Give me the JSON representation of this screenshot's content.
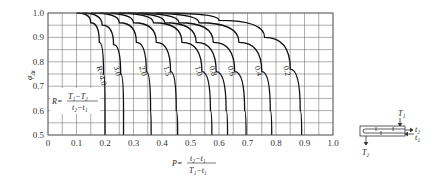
{
  "chart_data": {
    "type": "line",
    "title": "",
    "xlabel": "P = (t2 - t1) / (T1 - t1)",
    "ylabel": "φΔt",
    "xlim": [
      0,
      1.0
    ],
    "ylim": [
      0.5,
      1.0
    ],
    "grid": true,
    "x_ticks": [
      "0",
      "0.1",
      "0.2",
      "0.3",
      "0.4",
      "0.5",
      "0.6",
      "0.7",
      "0.8",
      "0.9",
      "1.0"
    ],
    "y_ticks": [
      "0.5",
      "0.6",
      "0.7",
      "0.8",
      "0.9",
      "1.0"
    ],
    "parameter_label": "R = (T1 - T2) / (t2 - t1)",
    "series": [
      {
        "name": "R=4.0",
        "label": "R=4.0",
        "points": [
          [
            0.1,
            1.0
          ],
          [
            0.15,
            0.96
          ],
          [
            0.18,
            0.88
          ],
          [
            0.195,
            0.75
          ],
          [
            0.2,
            0.6
          ],
          [
            0.2,
            0.5
          ]
        ]
      },
      {
        "name": "3.0",
        "label": "3.0",
        "points": [
          [
            0.12,
            1.0
          ],
          [
            0.19,
            0.95
          ],
          [
            0.23,
            0.87
          ],
          [
            0.255,
            0.75
          ],
          [
            0.265,
            0.6
          ],
          [
            0.265,
            0.5
          ]
        ]
      },
      {
        "name": "2.0",
        "label": "2.0",
        "points": [
          [
            0.15,
            1.0
          ],
          [
            0.25,
            0.96
          ],
          [
            0.31,
            0.88
          ],
          [
            0.345,
            0.76
          ],
          [
            0.36,
            0.6
          ],
          [
            0.362,
            0.5
          ]
        ]
      },
      {
        "name": "1.5",
        "label": "1.5",
        "points": [
          [
            0.18,
            1.0
          ],
          [
            0.3,
            0.96
          ],
          [
            0.38,
            0.88
          ],
          [
            0.43,
            0.76
          ],
          [
            0.45,
            0.6
          ],
          [
            0.455,
            0.5
          ]
        ]
      },
      {
        "name": "1.0",
        "label": "1.0",
        "points": [
          [
            0.22,
            1.0
          ],
          [
            0.37,
            0.96
          ],
          [
            0.47,
            0.88
          ],
          [
            0.54,
            0.76
          ],
          [
            0.57,
            0.6
          ],
          [
            0.575,
            0.5
          ]
        ]
      },
      {
        "name": "0.8",
        "label": "0.8",
        "points": [
          [
            0.25,
            1.0
          ],
          [
            0.41,
            0.96
          ],
          [
            0.52,
            0.88
          ],
          [
            0.59,
            0.76
          ],
          [
            0.625,
            0.6
          ],
          [
            0.63,
            0.5
          ]
        ]
      },
      {
        "name": "0.6",
        "label": "0.6",
        "points": [
          [
            0.28,
            1.0
          ],
          [
            0.46,
            0.96
          ],
          [
            0.58,
            0.88
          ],
          [
            0.655,
            0.76
          ],
          [
            0.69,
            0.6
          ],
          [
            0.695,
            0.5
          ]
        ]
      },
      {
        "name": "0.4",
        "label": "0.4",
        "points": [
          [
            0.32,
            1.0
          ],
          [
            0.53,
            0.96
          ],
          [
            0.67,
            0.88
          ],
          [
            0.75,
            0.76
          ],
          [
            0.78,
            0.6
          ],
          [
            0.785,
            0.5
          ]
        ]
      },
      {
        "name": "0.2",
        "label": "0.2",
        "points": [
          [
            0.38,
            1.0
          ],
          [
            0.6,
            0.97
          ],
          [
            0.76,
            0.9
          ],
          [
            0.85,
            0.77
          ],
          [
            0.885,
            0.6
          ],
          [
            0.89,
            0.5
          ]
        ]
      }
    ]
  },
  "labels": {
    "y_axis": "φ",
    "y_axis_sub": "Δt",
    "R_prefix": "R=",
    "R_num": "T₁−T₂",
    "R_den": "t₂−t₁",
    "P_prefix": "P=",
    "P_num": "t₂−t₁",
    "P_den": "T₁−t₁"
  },
  "schematic": {
    "T1": "T₁",
    "T2": "T₂",
    "t1": "t₁",
    "t2": "t₂"
  }
}
